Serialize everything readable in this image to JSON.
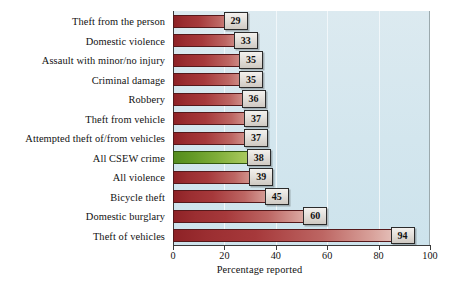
{
  "chart_data": {
    "type": "bar",
    "orientation": "horizontal",
    "title": "",
    "subtitle": "",
    "xlabel": "Percentage reported",
    "ylabel": "",
    "xlim": [
      0,
      100
    ],
    "xticks": [
      0,
      20,
      40,
      60,
      80,
      100
    ],
    "xtick_labels": [
      "0",
      "20",
      "40",
      "60",
      "80",
      "100"
    ],
    "grid": "vertical",
    "legend": "none",
    "categories": [
      "Theft from the person",
      "Domestic violence",
      "Assault with minor/no  injury",
      "Criminal damage",
      "Robbery",
      "Theft from vehicle",
      "Attempted theft of/from vehicles",
      "All CSEW crime",
      "All violence",
      "Bicycle theft",
      "Domestic burglary",
      "Theft of vehicles"
    ],
    "values": [
      29,
      33,
      35,
      35,
      36,
      37,
      37,
      38,
      39,
      45,
      60,
      94
    ],
    "value_labels": [
      "29",
      "33",
      "35",
      "35",
      "36",
      "37",
      "37",
      "38",
      "39",
      "45",
      "60",
      "94"
    ],
    "highlight_index": 7,
    "bar_colors": [
      "red",
      "red",
      "red",
      "red",
      "red",
      "red",
      "red",
      "green",
      "red",
      "red",
      "red",
      "red"
    ],
    "colors": {
      "bar_red_dark": "#8e2226",
      "bar_red_light": "#efdcd6",
      "bar_green_dark": "#548c1e",
      "bar_green_light": "#c6dd85",
      "plot_background": "#d6e8ef",
      "gridline": "#f2f8fa",
      "axis": "#3a3a3a",
      "page_background": "#ffffff",
      "value_box_fill": "#e3dfda",
      "value_box_border": "#2b2b2b"
    }
  }
}
